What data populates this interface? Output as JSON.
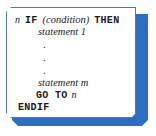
{
  "figure": {
    "name": "if-then-endif-pseudocode-block",
    "panel_background": "#ffffff",
    "border_color": "#4f79b8",
    "shadow_color": "#2b6cc4",
    "text_color": "#1a1a1a"
  },
  "code": {
    "line1": {
      "label_number": "n",
      "keyword_if": "IF",
      "condition": "(condition)",
      "keyword_then": "THEN"
    },
    "line2": {
      "statement": "statement 1"
    },
    "ellipsis": {
      "dot1": ".",
      "dot2": ".",
      "dot3": "."
    },
    "line3": {
      "statement": "statement m"
    },
    "line4": {
      "keyword_goto": "GO TO",
      "target": "n"
    },
    "line5": {
      "keyword_endif": "ENDIF"
    }
  }
}
